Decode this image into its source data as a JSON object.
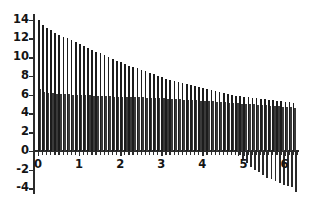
{
  "chart_data": {
    "type": "bar",
    "title": "",
    "subtitle": "",
    "xlabel": "",
    "ylabel": "",
    "xlim": [
      -0.12,
      6.35
    ],
    "ylim": [
      -4.6,
      14.6
    ],
    "grid": false,
    "legend": null,
    "x_ticks": [
      0,
      1,
      2,
      3,
      4,
      5,
      6
    ],
    "x_tick_labels": [
      "0",
      "1",
      "2",
      "3",
      "4",
      "5",
      "6"
    ],
    "y_ticks": [
      -4,
      -2,
      0,
      2,
      4,
      6,
      8,
      10,
      12,
      14
    ],
    "y_tick_labels": [
      "-4",
      "-2",
      "0",
      "2",
      "4",
      "6",
      "8",
      "10",
      "12",
      "14"
    ],
    "bar_width": 0.035,
    "series": [
      {
        "name": "primary-stems",
        "color": "#1c1c1c",
        "x": [
          0.02,
          0.12,
          0.22,
          0.32,
          0.42,
          0.52,
          0.62,
          0.72,
          0.82,
          0.92,
          1.02,
          1.12,
          1.22,
          1.32,
          1.42,
          1.52,
          1.62,
          1.72,
          1.82,
          1.92,
          2.02,
          2.12,
          2.22,
          2.32,
          2.42,
          2.52,
          2.62,
          2.72,
          2.82,
          2.92,
          3.02,
          3.12,
          3.22,
          3.32,
          3.42,
          3.52,
          3.62,
          3.72,
          3.82,
          3.92,
          4.02,
          4.12,
          4.22,
          4.32,
          4.42,
          4.52,
          4.62,
          4.72,
          4.82,
          4.92,
          5.02,
          5.12,
          5.22,
          5.32,
          5.42,
          5.52,
          5.62,
          5.72,
          5.82,
          5.92,
          6.02,
          6.12,
          6.22
        ],
        "values": [
          14.0,
          13.4,
          13.1,
          12.9,
          12.6,
          12.4,
          12.2,
          12.0,
          11.8,
          11.6,
          11.4,
          11.2,
          11.0,
          10.8,
          10.6,
          10.4,
          10.2,
          10.0,
          9.8,
          9.6,
          9.5,
          9.3,
          9.1,
          9.0,
          8.8,
          8.6,
          8.5,
          8.3,
          8.2,
          8.0,
          7.9,
          7.7,
          7.6,
          7.5,
          7.3,
          7.2,
          7.1,
          7.0,
          6.9,
          6.8,
          6.7,
          6.6,
          6.5,
          6.4,
          6.3,
          6.2,
          6.1,
          6.0,
          5.9,
          5.85,
          5.8,
          5.7,
          5.65,
          5.6,
          5.55,
          5.5,
          5.45,
          5.4,
          5.35,
          5.3,
          5.25,
          5.2,
          5.15
        ]
      },
      {
        "name": "secondary-stems",
        "color": "#3a3a3a",
        "x": [
          0.06,
          0.16,
          0.26,
          0.36,
          0.46,
          0.56,
          0.66,
          0.76,
          0.86,
          0.96,
          1.06,
          1.16,
          1.26,
          1.36,
          1.46,
          1.56,
          1.66,
          1.76,
          1.86,
          1.96,
          2.06,
          2.16,
          2.26,
          2.36,
          2.46,
          2.56,
          2.66,
          2.76,
          2.86,
          2.96,
          3.06,
          3.16,
          3.26,
          3.36,
          3.46,
          3.56,
          3.66,
          3.76,
          3.86,
          3.96,
          4.06,
          4.16,
          4.26,
          4.36,
          4.46,
          4.56,
          4.66,
          4.76,
          4.86,
          4.96,
          5.06,
          5.16,
          5.26,
          5.36,
          5.46,
          5.56,
          5.66,
          5.76,
          5.86,
          5.96,
          6.06,
          6.16,
          6.26
        ],
        "values": [
          6.6,
          6.3,
          6.2,
          6.15,
          6.1,
          6.1,
          6.05,
          6.05,
          6.0,
          6.0,
          6.0,
          5.95,
          5.95,
          5.9,
          5.9,
          5.9,
          5.85,
          5.85,
          5.8,
          5.8,
          5.8,
          5.75,
          5.75,
          5.7,
          5.7,
          5.7,
          5.65,
          5.65,
          5.6,
          5.6,
          5.6,
          5.55,
          5.5,
          5.5,
          5.5,
          5.45,
          5.45,
          5.4,
          5.4,
          5.35,
          5.35,
          5.3,
          5.3,
          5.25,
          5.2,
          5.2,
          5.15,
          5.1,
          5.1,
          5.05,
          5.0,
          5.0,
          4.95,
          4.9,
          4.9,
          4.85,
          4.8,
          4.8,
          4.75,
          4.7,
          4.7,
          4.65,
          4.6
        ]
      },
      {
        "name": "negative-stems",
        "color": "#2a2a2a",
        "x": [
          4.88,
          4.98,
          5.08,
          5.18,
          5.28,
          5.38,
          5.48,
          5.58,
          5.68,
          5.78,
          5.88,
          5.98,
          6.08,
          6.18,
          6.28
        ],
        "values": [
          -0.5,
          -0.9,
          -1.3,
          -1.7,
          -2.0,
          -2.3,
          -2.6,
          -2.85,
          -3.05,
          -3.25,
          -3.45,
          -3.6,
          -3.75,
          -3.9,
          -4.35
        ]
      }
    ]
  },
  "axes": {
    "x_axis_name": "x-axis",
    "y_axis_name": "y-axis"
  }
}
